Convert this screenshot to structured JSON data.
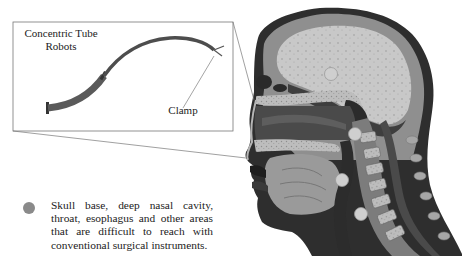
{
  "inset": {
    "title_line1": "Concentric Tube",
    "title_line2": "Robots",
    "clamp_label": "Clamp"
  },
  "bullet": {
    "text": "Skull base, deep nasal cavity, throat, esophagus and other areas that are difficult to reach with conventional surgical instruments.",
    "dot_color": "#8a8a8a"
  },
  "anatomy": {
    "target_sites": [
      {
        "name": "skull-base",
        "x": 331,
        "y": 74
      },
      {
        "name": "nasopharynx",
        "x": 355,
        "y": 134
      },
      {
        "name": "throat",
        "x": 342,
        "y": 180
      },
      {
        "name": "esophagus",
        "x": 361,
        "y": 214
      }
    ],
    "marker_color": "#c9c9c9"
  }
}
